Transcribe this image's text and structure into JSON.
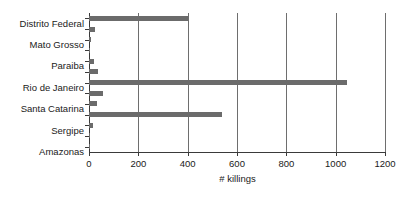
{
  "chart_data": {
    "type": "bar",
    "orientation": "horizontal",
    "title": "",
    "xlabel": "# killings",
    "ylabel": "",
    "xlim": [
      0,
      1200
    ],
    "xticks": [
      0,
      200,
      400,
      600,
      800,
      1000,
      1200
    ],
    "grid": "vertical",
    "legend": "none",
    "bar_color": "#6b6b6b",
    "axis_color": "#3a3a3a",
    "categories": [
      "Distrito Federal",
      "",
      "Mato Grosso",
      "",
      "Paraiba",
      "",
      "Rio de Janeiro",
      "",
      "Santa Catarina",
      "",
      "Sergipe",
      "",
      "Amazonas"
    ],
    "labeled_categories": [
      "Distrito Federal",
      "Mato Grosso",
      "Paraiba",
      "Rio de Janeiro",
      "Santa Catarina",
      "Sergipe",
      "Amazonas"
    ],
    "values": [
      400,
      25,
      10,
      3,
      20,
      35,
      1045,
      55,
      33,
      540,
      18,
      2,
      5
    ]
  }
}
